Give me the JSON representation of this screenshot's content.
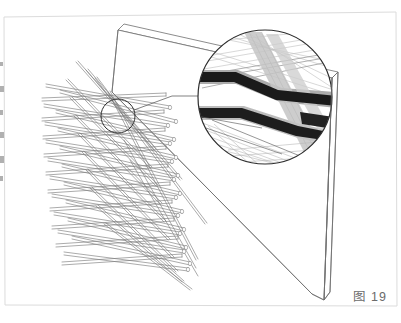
{
  "figure": {
    "caption": "图 19",
    "caption_color": "#6b6b6b",
    "background_color": "#ffffff",
    "page_border_color": "#dcdcdc",
    "line_color": "#5a5a5a",
    "outline_color": "#6e6e6e",
    "rod_color": "#7d7d7d",
    "dark_band_color": "#1a1a1a",
    "mid_band_color": "#8c8c8c",
    "light_band_color": "#bdbdbd",
    "type": "technical-line-drawing"
  },
  "slab": {
    "name": "panel-slab",
    "top_face": "118,30 332,78 338,72 124,24",
    "front_face": "118,30 124,24 318,89 312,96",
    "right_edge": "332,78 338,72 330,292 324,300",
    "bottom_edge": "112,92 312,294",
    "left_edge": "118,30 112,92"
  },
  "detail": {
    "marker_circle": {
      "cx": 118,
      "cy": 116,
      "r": 17
    },
    "magnifier_circle": {
      "cx": 265,
      "cy": 97,
      "r": 67
    },
    "leader_line": {
      "x1": 134,
      "y1": 110,
      "x2": 172,
      "y2": 96,
      "x3": 205,
      "y3": 96
    }
  },
  "edge_marks": [
    {
      "y": 62,
      "h": 4
    },
    {
      "y": 86,
      "h": 6
    },
    {
      "y": 110,
      "h": 5
    },
    {
      "y": 132,
      "h": 6
    },
    {
      "y": 156,
      "h": 7
    },
    {
      "y": 176,
      "h": 5
    }
  ],
  "rod_rows": [
    {
      "y": 96,
      "count": 7
    },
    {
      "y": 112,
      "count": 7
    },
    {
      "y": 128,
      "count": 7
    },
    {
      "y": 144,
      "count": 7
    },
    {
      "y": 160,
      "count": 7
    },
    {
      "y": 176,
      "count": 7
    },
    {
      "y": 192,
      "count": 7
    },
    {
      "y": 208,
      "count": 7
    },
    {
      "y": 224,
      "count": 7
    },
    {
      "y": 240,
      "count": 7
    }
  ]
}
